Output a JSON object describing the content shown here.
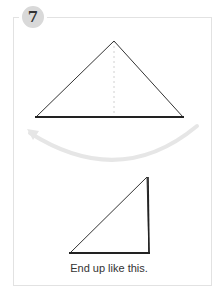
{
  "step": {
    "number": "7",
    "badge_color": "#d9d9d9"
  },
  "diagram": {
    "top_shape": "isosceles-triangle-with-dotted-centerline",
    "arrow": "curved-fold-arrow-right-to-left",
    "arrow_color": "#e6e6e6",
    "bottom_shape": "right-triangle"
  },
  "caption": "End up like this."
}
